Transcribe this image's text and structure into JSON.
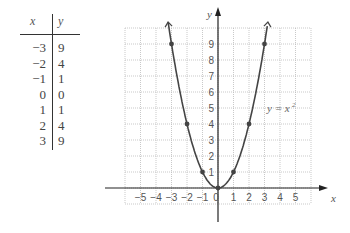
{
  "table": {
    "headers": [
      "x",
      "y"
    ],
    "rows": [
      {
        "x": "−3",
        "y": "9"
      },
      {
        "x": "−2",
        "y": "4"
      },
      {
        "x": "−1",
        "y": "1"
      },
      {
        "x": "0",
        "y": "0"
      },
      {
        "x": "1",
        "y": "1"
      },
      {
        "x": "2",
        "y": "4"
      },
      {
        "x": "3",
        "y": "9"
      }
    ]
  },
  "chart_data": {
    "type": "line",
    "title": "",
    "equation_label": "y = x²",
    "xlabel": "x",
    "ylabel": "y",
    "x": [
      -3,
      -2,
      -1,
      0,
      1,
      2,
      3
    ],
    "series": [
      {
        "name": "y = x^2",
        "values": [
          9,
          4,
          1,
          0,
          1,
          4,
          9
        ]
      }
    ],
    "x_ticks": [
      "−5",
      "−4",
      "−3",
      "−2",
      "−1",
      "0",
      "1",
      "2",
      "3",
      "4",
      "5"
    ],
    "y_ticks": [
      "1",
      "2",
      "3",
      "4",
      "5",
      "6",
      "7",
      "8",
      "9"
    ],
    "xlim": [
      -6,
      6
    ],
    "ylim": [
      -1,
      10
    ],
    "grid": true,
    "colors": {
      "curve": "#444444",
      "grid": "#bbbbbb",
      "axis": "#222222"
    }
  }
}
